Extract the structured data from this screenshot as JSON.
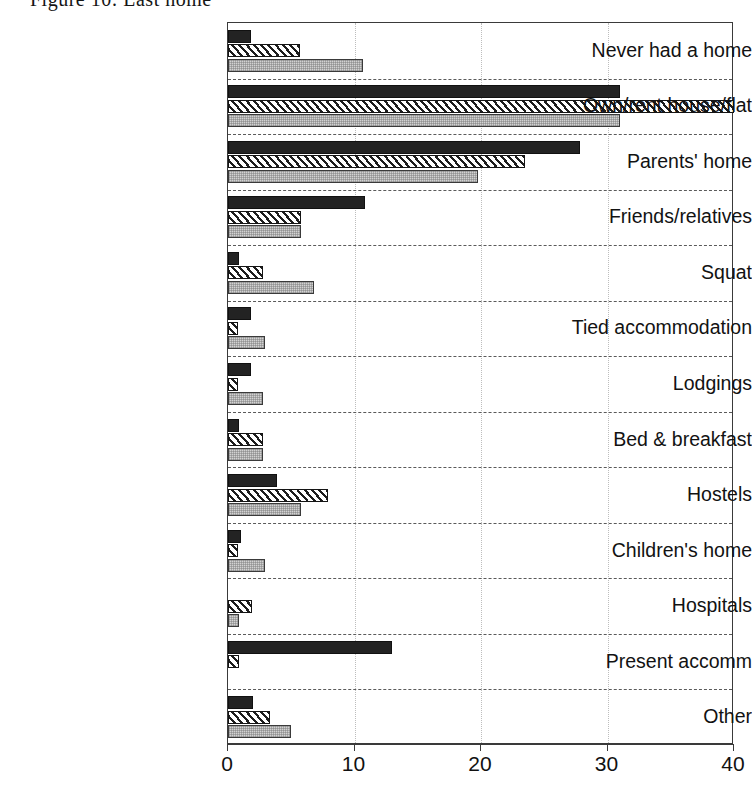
{
  "figure": {
    "title": "Figure 10: Last home"
  },
  "chart_data": {
    "type": "bar",
    "orientation": "horizontal",
    "title": "Figure 10: Last home",
    "xlabel": "",
    "ylabel": "",
    "xlim": [
      0,
      40
    ],
    "xticks": [
      0,
      10,
      20,
      30,
      40
    ],
    "xtick_labels": [
      "0",
      "10",
      "20",
      "30",
      "40"
    ],
    "grid": "dotted vertical gridlines; dashed horizontal category separators",
    "legend": "none shown",
    "categories": [
      "Never had a home",
      "Own/rent house/flat",
      "Parents' home",
      "Friends/relatives",
      "Squat",
      "Tied accommodation",
      "Lodgings",
      "Bed & breakfast",
      "Hostels",
      "Children's home",
      "Hospitals",
      "Present accomm",
      "Other"
    ],
    "series": [
      {
        "name": "Series 1",
        "pattern": "solid-black",
        "color": "#232323",
        "values": [
          1.8,
          31.0,
          27.8,
          10.8,
          0.9,
          1.8,
          1.8,
          0.9,
          3.9,
          1.0,
          0.0,
          13.0,
          2.0
        ]
      },
      {
        "name": "Series 2",
        "pattern": "diagonal-hatch",
        "color": "#ffffff",
        "values": [
          5.7,
          40.0,
          23.5,
          5.8,
          2.8,
          0.8,
          0.8,
          2.8,
          7.9,
          0.8,
          1.9,
          0.9,
          3.3
        ]
      },
      {
        "name": "Series 3",
        "pattern": "stipple-gray",
        "color": "#d2d2d2",
        "values": [
          10.7,
          31.0,
          19.8,
          5.8,
          6.8,
          2.9,
          2.8,
          2.8,
          5.8,
          2.9,
          0.9,
          0.0,
          5.0
        ]
      }
    ]
  }
}
